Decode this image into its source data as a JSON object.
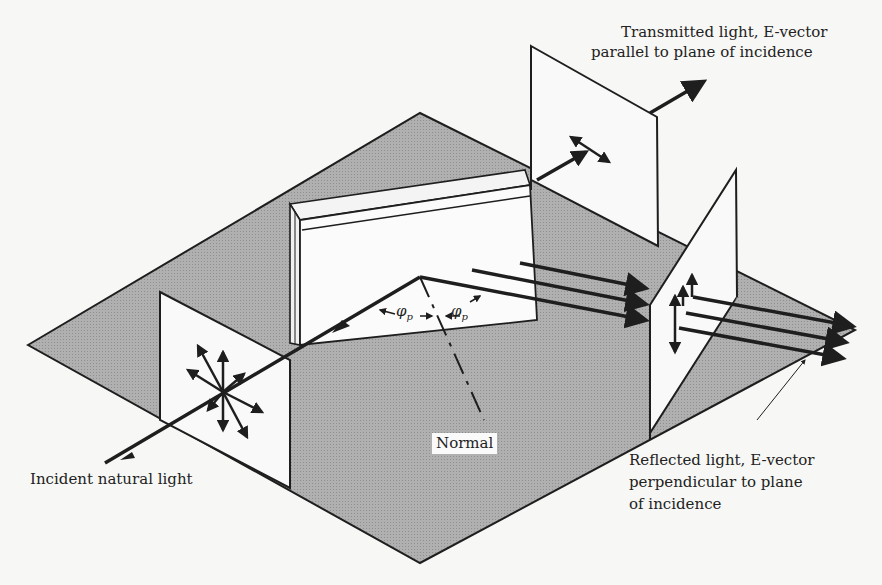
{
  "figure": {
    "labels": {
      "transmitted_line1": "Transmitted light, E-vector",
      "transmitted_line2": "parallel to plane of incidence",
      "incident": "Incident natural light",
      "normal": "Normal",
      "reflected_line1": "Reflected light, E-vector",
      "reflected_line2": "perpendicular to plane",
      "reflected_line3": "of incidence",
      "angle_symbol": "φ",
      "angle_subscript": "p"
    },
    "colors": {
      "background": "#f7f7f5",
      "plane_fill": "#a9a9a9",
      "screen_fill": "#f9f9f9",
      "stroke": "#1e1e1e"
    }
  }
}
